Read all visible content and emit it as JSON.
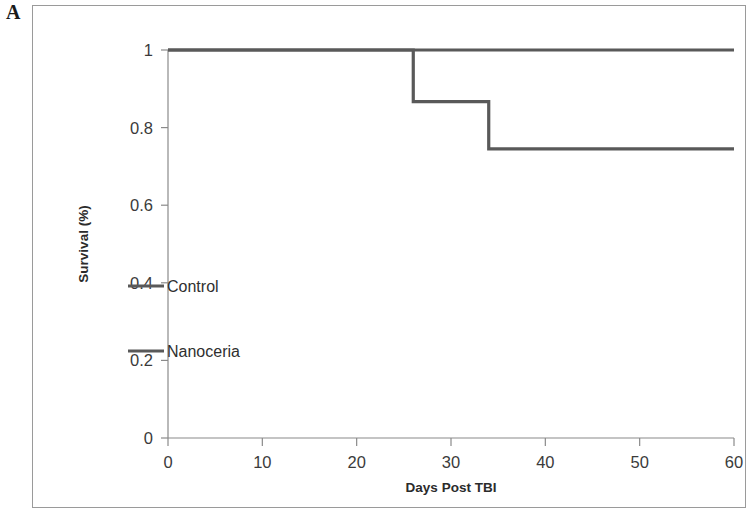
{
  "figure": {
    "panel_label": "A"
  },
  "chart_data": {
    "type": "line",
    "title": "",
    "subtitle": "",
    "xlabel": "Days Post TBI",
    "ylabel": "Survival (%)",
    "xlim": [
      0,
      60
    ],
    "ylim": [
      0,
      1
    ],
    "xticks": [
      0,
      10,
      20,
      30,
      40,
      50,
      60
    ],
    "xtick_labels": [
      "0",
      "10",
      "20",
      "30",
      "40",
      "50",
      "60"
    ],
    "yticks": [
      0,
      0.2,
      0.4,
      0.6,
      0.8,
      1
    ],
    "ytick_labels": [
      "0",
      "0.2",
      "0.4",
      "0.6",
      "0.8",
      "1"
    ],
    "grid": false,
    "legend_position": "inside-left-middle",
    "step_style": "post",
    "line_color": "#595959",
    "series": [
      {
        "name": "Control",
        "color": "#595959",
        "x": [
          0,
          26,
          26,
          34,
          34,
          60
        ],
        "y": [
          1.0,
          1.0,
          0.867,
          0.867,
          0.745,
          0.745
        ],
        "events": [
          {
            "day": 26,
            "survival_from": 1.0,
            "survival_to": 0.867
          },
          {
            "day": 34,
            "survival_from": 0.867,
            "survival_to": 0.745
          }
        ]
      },
      {
        "name": "Nanoceria",
        "color": "#595959",
        "x": [
          0,
          60
        ],
        "y": [
          1.0,
          1.0
        ],
        "events": []
      }
    ]
  },
  "legend": {
    "entries": [
      {
        "label": "Control",
        "color": "#595959"
      },
      {
        "label": "Nanoceria",
        "color": "#595959"
      }
    ]
  }
}
